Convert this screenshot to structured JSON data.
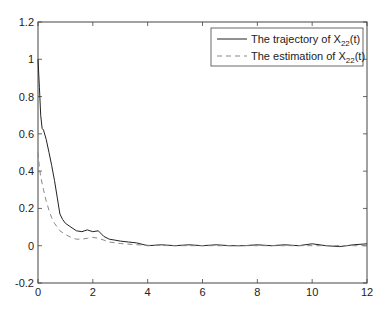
{
  "chart_data": {
    "type": "line",
    "title": "",
    "xlabel": "",
    "ylabel": "",
    "xlim": [
      0,
      12
    ],
    "ylim": [
      -0.2,
      1.2
    ],
    "xticks": [
      0,
      2,
      4,
      6,
      8,
      10,
      12
    ],
    "yticks": [
      -0.2,
      0,
      0.2,
      0.4,
      0.6,
      0.8,
      1,
      1.2
    ],
    "xtick_labels": [
      "0",
      "2",
      "4",
      "6",
      "8",
      "10",
      "12"
    ],
    "ytick_labels": [
      "-0.2",
      "0",
      "0.2",
      "0.4",
      "0.6",
      "0.8",
      "1",
      "1.2"
    ],
    "grid": false,
    "legend_position": "upper right",
    "series": [
      {
        "name": "The trajectory of X22(t)",
        "legend_main": "The trajectory of X",
        "legend_sub": "22",
        "legend_tail": "(t)",
        "style": "solid",
        "color": "#222222",
        "x": [
          0,
          0.05,
          0.1,
          0.15,
          0.2,
          0.3,
          0.4,
          0.5,
          0.6,
          0.7,
          0.8,
          0.9,
          1.0,
          1.2,
          1.4,
          1.6,
          1.8,
          2.0,
          2.2,
          2.4,
          2.6,
          2.8,
          3.0,
          3.3,
          3.6,
          4.0,
          4.5,
          5.0,
          5.5,
          6.0,
          6.5,
          7.0,
          7.5,
          8.0,
          8.5,
          9.0,
          9.5,
          10.0,
          10.5,
          11.0,
          11.5,
          12.0
        ],
        "y": [
          1.0,
          0.85,
          0.7,
          0.63,
          0.62,
          0.57,
          0.5,
          0.43,
          0.35,
          0.26,
          0.17,
          0.14,
          0.12,
          0.1,
          0.08,
          0.075,
          0.085,
          0.075,
          0.08,
          0.05,
          0.035,
          0.03,
          0.025,
          0.02,
          0.015,
          0.0,
          0.005,
          0.0,
          0.005,
          0.0,
          0.005,
          0.0,
          0.0,
          0.005,
          0.0,
          0.005,
          0.0,
          0.01,
          0.0,
          -0.005,
          0.005,
          0.01
        ]
      },
      {
        "name": "The estimation of X22(t)",
        "legend_main": "The estimation of X",
        "legend_sub": "22",
        "legend_tail": "(t)",
        "style": "dashed",
        "color": "#888888",
        "x": [
          0,
          0.05,
          0.1,
          0.2,
          0.3,
          0.4,
          0.5,
          0.6,
          0.8,
          1.0,
          1.2,
          1.4,
          1.6,
          1.8,
          2.0,
          2.2,
          2.4,
          2.6,
          3.0,
          3.5,
          4.0,
          5.0,
          6.0,
          8.0,
          10.0,
          12.0
        ],
        "y": [
          0.5,
          0.42,
          0.37,
          0.3,
          0.24,
          0.19,
          0.15,
          0.12,
          0.08,
          0.06,
          0.045,
          0.035,
          0.035,
          0.04,
          0.045,
          0.04,
          0.03,
          0.02,
          0.012,
          0.006,
          0.002,
          0.0,
          0.0,
          0.0,
          0.0,
          0.0
        ]
      }
    ]
  }
}
